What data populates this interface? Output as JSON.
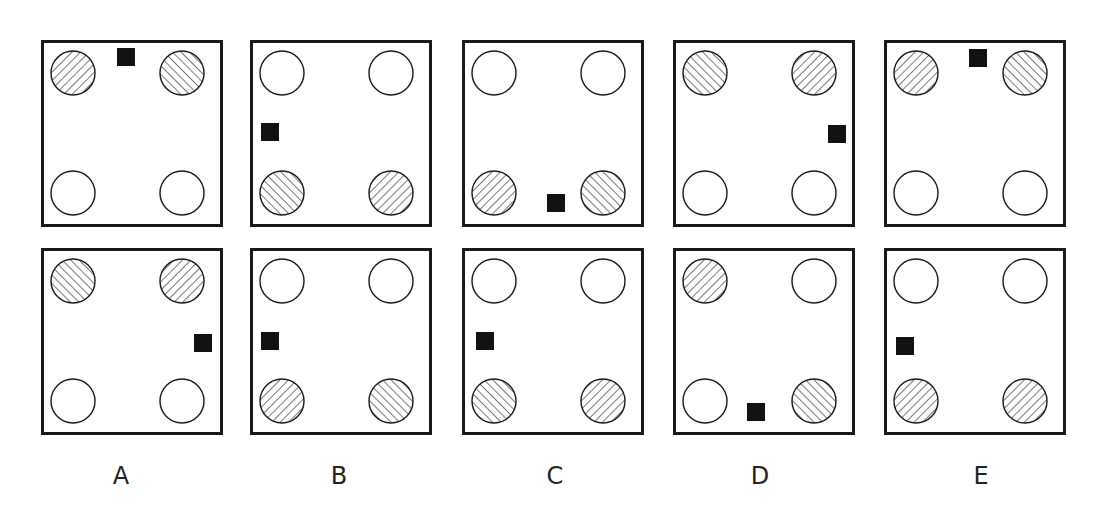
{
  "colors": {
    "stroke": "#1a1a1a",
    "hatch": "#7a7a7a",
    "marker": "#111111",
    "background": "#ffffff"
  },
  "legend": {
    "hatch_back": "diagonal hatching running top-left to bottom-right",
    "hatch_fwd": "diagonal hatching running bottom-left to top-right",
    "empty": "unfilled circle"
  },
  "options": [
    {
      "label": "A",
      "panels": [
        {
          "circles": {
            "tl": "back",
            "tr": "fwd",
            "bl": "empty",
            "br": "empty"
          },
          "square": {
            "position": "top-center",
            "x": 76,
            "y": 8
          }
        },
        {
          "circles": {
            "tl": "fwd",
            "tr": "back",
            "bl": "empty",
            "br": "empty"
          },
          "square": {
            "position": "right-middle",
            "x": 153,
            "y": 86
          }
        }
      ]
    },
    {
      "label": "B",
      "panels": [
        {
          "circles": {
            "tl": "empty",
            "tr": "empty",
            "bl": "fwd",
            "br": "back"
          },
          "square": {
            "position": "left-middle",
            "x": 11,
            "y": 83
          }
        },
        {
          "circles": {
            "tl": "empty",
            "tr": "empty",
            "bl": "back",
            "br": "fwd"
          },
          "square": {
            "position": "left-middle",
            "x": 11,
            "y": 84
          }
        }
      ]
    },
    {
      "label": "C",
      "panels": [
        {
          "circles": {
            "tl": "empty",
            "tr": "empty",
            "bl": "back",
            "br": "fwd"
          },
          "square": {
            "position": "bottom-center",
            "x": 85,
            "y": 154
          }
        },
        {
          "circles": {
            "tl": "empty",
            "tr": "empty",
            "bl": "fwd",
            "br": "back"
          },
          "square": {
            "position": "left-middle",
            "x": 14,
            "y": 84
          }
        }
      ]
    },
    {
      "label": "D",
      "panels": [
        {
          "circles": {
            "tl": "fwd",
            "tr": "back",
            "bl": "empty",
            "br": "empty"
          },
          "square": {
            "position": "right-middle",
            "x": 155,
            "y": 85
          }
        },
        {
          "circles": {
            "tl": "back",
            "tr": "empty",
            "bl": "empty",
            "br": "fwd"
          },
          "square": {
            "position": "bottom-center",
            "x": 74,
            "y": 155
          }
        }
      ]
    },
    {
      "label": "E",
      "panels": [
        {
          "circles": {
            "tl": "back",
            "tr": "fwd",
            "bl": "empty",
            "br": "empty"
          },
          "square": {
            "position": "top-center",
            "x": 85,
            "y": 9
          }
        },
        {
          "circles": {
            "tl": "empty",
            "tr": "empty",
            "bl": "back",
            "br": "back"
          },
          "square": {
            "position": "left-middle",
            "x": 12,
            "y": 89
          }
        }
      ]
    }
  ]
}
